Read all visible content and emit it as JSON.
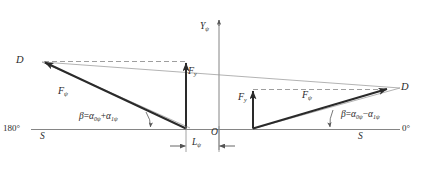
{
  "figure": {
    "type": "vector-force-diagram",
    "background_color": "#ffffff",
    "line_color": "#2a2a2a",
    "thin_line_color": "#8a8a8a",
    "axis_color": "#777777"
  },
  "axes": {
    "vertical_axis_label": "Y",
    "vertical_axis_sub": "ψ",
    "origin_label": "O",
    "left_end_label": "180°",
    "right_end_label": "0°",
    "baseline_left_marker": "S",
    "baseline_right_marker": "S"
  },
  "dimension": {
    "label": "L",
    "sub": "ψ"
  },
  "left_triangle": {
    "apex_label": "D",
    "force_label": "F",
    "force_sub": "ψ",
    "vertical_force_label": "F",
    "vertical_force_sub": "y",
    "angle_expr_lhs": "β",
    "angle_expr_eq": "=",
    "angle_term1": "α",
    "angle_term1_sub": "0ψ",
    "angle_operator": "+",
    "angle_term2": "α",
    "angle_term2_sub": "1ψ"
  },
  "right_triangle": {
    "apex_label": "D",
    "force_label": "F",
    "force_sub": "ψ",
    "vertical_force_label": "F",
    "vertical_force_sub": "y",
    "angle_expr_lhs": "β",
    "angle_expr_eq": "=",
    "angle_term1": "α",
    "angle_term1_sub": "0ψ",
    "angle_operator": "−",
    "angle_term2": "α",
    "angle_term2_sub": "1ψ"
  }
}
